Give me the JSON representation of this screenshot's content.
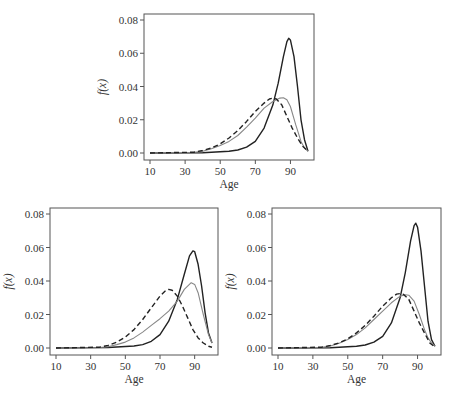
{
  "chart_data": [
    {
      "type": "line",
      "position": "top",
      "xlabel": "Age",
      "ylabel": "f(x)",
      "xticks": [
        10,
        30,
        50,
        70,
        90
      ],
      "yticks": [
        "0.00",
        "0.02",
        "0.04",
        "0.06",
        "0.08"
      ],
      "xlim": [
        10,
        100
      ],
      "ylim": [
        0,
        0.08
      ],
      "legend": "none",
      "series": [
        {
          "name": "black-solid",
          "style": "solid",
          "color": "#222222",
          "x": [
            10,
            40,
            55,
            60,
            65,
            70,
            75,
            80,
            83,
            86,
            88,
            89,
            90,
            92,
            94,
            96,
            98,
            100
          ],
          "y": [
            0,
            0.0002,
            0.001,
            0.0018,
            0.0035,
            0.007,
            0.015,
            0.029,
            0.042,
            0.058,
            0.067,
            0.069,
            0.068,
            0.058,
            0.04,
            0.02,
            0.008,
            0.001
          ]
        },
        {
          "name": "gray-solid",
          "style": "solid",
          "color": "#888888",
          "x": [
            10,
            35,
            40,
            45,
            50,
            55,
            60,
            65,
            70,
            75,
            80,
            84,
            86,
            88,
            90,
            93,
            96,
            98,
            100
          ],
          "y": [
            0,
            0.0004,
            0.001,
            0.0025,
            0.0045,
            0.007,
            0.0105,
            0.0155,
            0.021,
            0.027,
            0.031,
            0.033,
            0.0332,
            0.032,
            0.028,
            0.017,
            0.007,
            0.003,
            0.001
          ]
        },
        {
          "name": "black-dashed",
          "style": "dashed",
          "color": "#222222",
          "x": [
            10,
            35,
            40,
            45,
            50,
            55,
            60,
            65,
            70,
            75,
            78,
            80,
            82,
            85,
            88,
            91,
            94,
            97,
            100
          ],
          "y": [
            0,
            0.0005,
            0.0015,
            0.003,
            0.0055,
            0.009,
            0.0135,
            0.019,
            0.025,
            0.03,
            0.0325,
            0.033,
            0.0325,
            0.029,
            0.022,
            0.015,
            0.009,
            0.004,
            0.001
          ]
        }
      ]
    },
    {
      "type": "line",
      "position": "bottom-left",
      "xlabel": "Age",
      "ylabel": "f(x)",
      "xticks": [
        10,
        30,
        50,
        70,
        90
      ],
      "yticks": [
        "0.00",
        "0.02",
        "0.04",
        "0.06",
        "0.08"
      ],
      "xlim": [
        10,
        100
      ],
      "ylim": [
        0,
        0.08
      ],
      "legend": "none",
      "series": [
        {
          "name": "black-solid",
          "style": "solid",
          "color": "#222222",
          "x": [
            10,
            40,
            55,
            60,
            65,
            70,
            75,
            80,
            84,
            87,
            89,
            90,
            92,
            94,
            96,
            98,
            100
          ],
          "y": [
            0,
            0.0003,
            0.0012,
            0.002,
            0.004,
            0.008,
            0.016,
            0.029,
            0.044,
            0.055,
            0.058,
            0.0575,
            0.05,
            0.037,
            0.021,
            0.009,
            0.003
          ]
        },
        {
          "name": "gray-solid",
          "style": "solid",
          "color": "#888888",
          "x": [
            10,
            35,
            40,
            45,
            50,
            55,
            60,
            65,
            70,
            75,
            80,
            84,
            88,
            90,
            92,
            95,
            98,
            100
          ],
          "y": [
            0,
            0.0003,
            0.0008,
            0.002,
            0.0035,
            0.006,
            0.0095,
            0.0135,
            0.0175,
            0.022,
            0.028,
            0.035,
            0.039,
            0.038,
            0.033,
            0.02,
            0.008,
            0.003
          ]
        },
        {
          "name": "black-dashed",
          "style": "dashed",
          "color": "#222222",
          "x": [
            10,
            35,
            40,
            45,
            50,
            55,
            60,
            65,
            70,
            73,
            75,
            77,
            80,
            83,
            86,
            89,
            92,
            95,
            98,
            100
          ],
          "y": [
            0,
            0.0005,
            0.0015,
            0.0035,
            0.0065,
            0.011,
            0.017,
            0.024,
            0.031,
            0.034,
            0.035,
            0.0345,
            0.031,
            0.025,
            0.018,
            0.011,
            0.006,
            0.003,
            0.001,
            0.0005
          ]
        }
      ]
    },
    {
      "type": "line",
      "position": "bottom-right",
      "xlabel": "Age",
      "ylabel": "f(x)",
      "xticks": [
        10,
        30,
        50,
        70,
        90
      ],
      "yticks": [
        "0.00",
        "0.02",
        "0.04",
        "0.06",
        "0.08"
      ],
      "xlim": [
        10,
        100
      ],
      "ylim": [
        0,
        0.08
      ],
      "legend": "none",
      "series": [
        {
          "name": "black-solid",
          "style": "solid",
          "color": "#222222",
          "x": [
            10,
            40,
            55,
            60,
            65,
            70,
            75,
            80,
            83,
            86,
            88,
            89,
            90,
            92,
            94,
            96,
            98,
            100
          ],
          "y": [
            0,
            0.0002,
            0.001,
            0.0018,
            0.0035,
            0.007,
            0.015,
            0.03,
            0.045,
            0.064,
            0.073,
            0.0745,
            0.072,
            0.058,
            0.037,
            0.016,
            0.005,
            0.001
          ]
        },
        {
          "name": "gray-solid",
          "style": "solid",
          "color": "#888888",
          "x": [
            10,
            35,
            40,
            45,
            50,
            55,
            60,
            65,
            70,
            75,
            80,
            83,
            85,
            88,
            91,
            94,
            96,
            98,
            100
          ],
          "y": [
            0,
            0.0005,
            0.0012,
            0.0028,
            0.005,
            0.008,
            0.012,
            0.017,
            0.022,
            0.027,
            0.031,
            0.0318,
            0.0315,
            0.028,
            0.02,
            0.011,
            0.006,
            0.003,
            0.001
          ]
        },
        {
          "name": "black-dashed",
          "style": "dashed",
          "color": "#222222",
          "x": [
            10,
            35,
            40,
            45,
            50,
            55,
            60,
            65,
            70,
            75,
            78,
            80,
            82,
            85,
            88,
            91,
            94,
            97,
            100
          ],
          "y": [
            0,
            0.0005,
            0.0015,
            0.003,
            0.0055,
            0.009,
            0.0135,
            0.019,
            0.025,
            0.03,
            0.0322,
            0.0325,
            0.032,
            0.029,
            0.022,
            0.015,
            0.009,
            0.003,
            0.0005
          ]
        }
      ]
    }
  ],
  "panels": [
    {
      "x0": 144,
      "y0": 14,
      "x1": 314,
      "y1": 160
    },
    {
      "x0": 50,
      "y0": 208,
      "x1": 218,
      "y1": 355
    },
    {
      "x0": 272,
      "y0": 208,
      "x1": 441,
      "y1": 355
    }
  ]
}
